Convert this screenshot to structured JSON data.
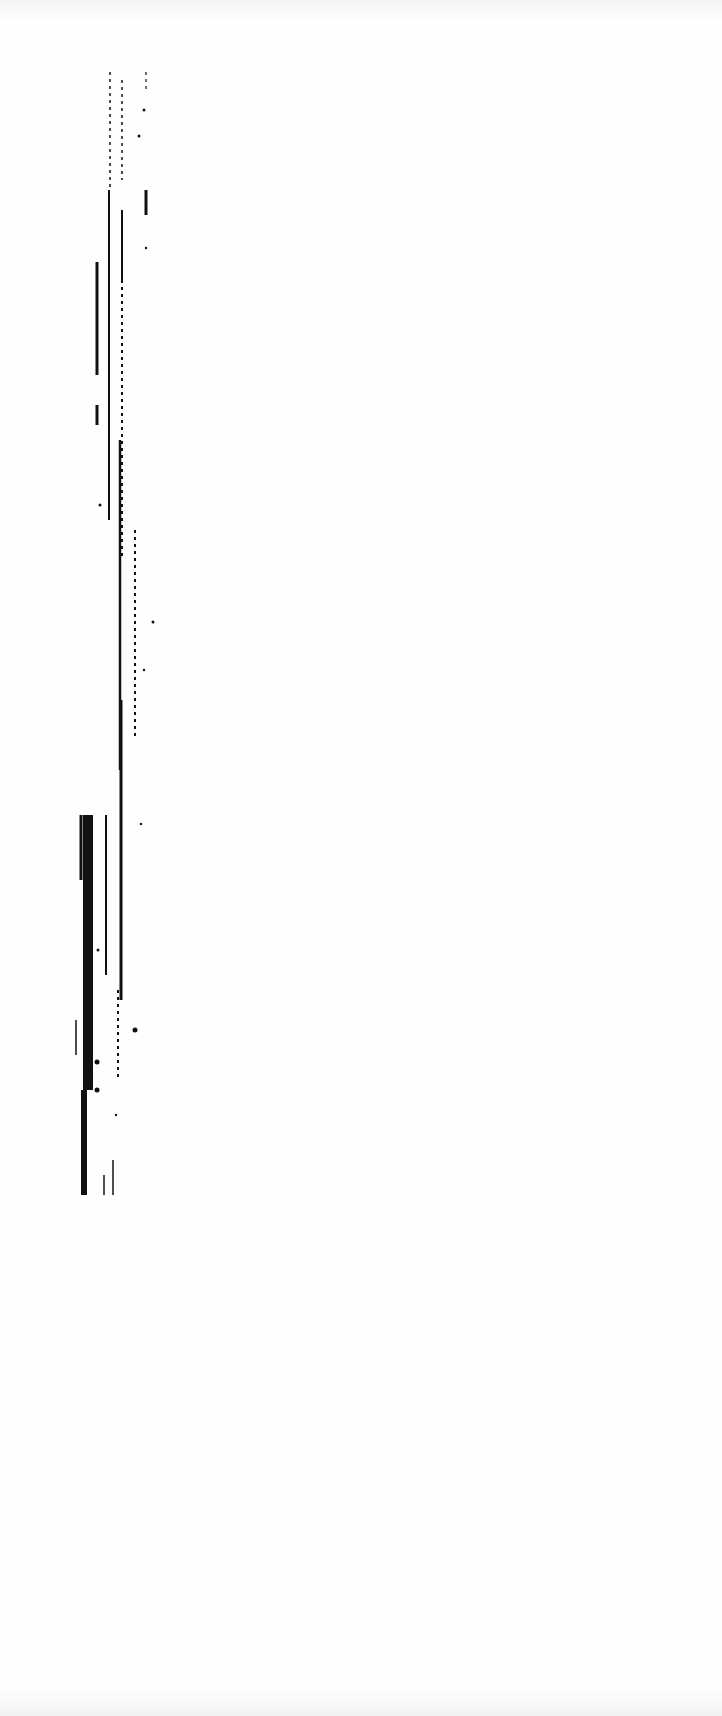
{
  "document": {
    "type": "scanned-page",
    "legible_text": "",
    "background": "#fefefe",
    "ink_color": "#111111"
  },
  "scan_marks": {
    "lines": [
      {
        "x": 110,
        "y1": 72,
        "y2": 190,
        "w": 1.5,
        "dashed": true
      },
      {
        "x": 122,
        "y1": 80,
        "y2": 180,
        "w": 1.5,
        "dashed": true
      },
      {
        "x": 146,
        "y1": 72,
        "y2": 90,
        "w": 1.2,
        "dashed": true
      },
      {
        "x": 146,
        "y1": 190,
        "y2": 215,
        "w": 3,
        "dashed": false
      },
      {
        "x": 97,
        "y1": 262,
        "y2": 375,
        "w": 3,
        "dashed": false
      },
      {
        "x": 97,
        "y1": 405,
        "y2": 425,
        "w": 3,
        "dashed": false
      },
      {
        "x": 109,
        "y1": 190,
        "y2": 520,
        "w": 2,
        "dashed": false
      },
      {
        "x": 122,
        "y1": 210,
        "y2": 280,
        "w": 2,
        "dashed": false
      },
      {
        "x": 122,
        "y1": 280,
        "y2": 560,
        "w": 2,
        "dashed": true
      },
      {
        "x": 120,
        "y1": 440,
        "y2": 770,
        "w": 2.5,
        "dashed": false
      },
      {
        "x": 121,
        "y1": 700,
        "y2": 1000,
        "w": 3,
        "dashed": false
      },
      {
        "x": 135,
        "y1": 530,
        "y2": 740,
        "w": 2,
        "dashed": true
      },
      {
        "x": 118,
        "y1": 990,
        "y2": 1080,
        "w": 2,
        "dashed": true
      },
      {
        "x": 88,
        "y1": 815,
        "y2": 1090,
        "w": 10,
        "dashed": false
      },
      {
        "x": 84,
        "y1": 1090,
        "y2": 1195,
        "w": 6,
        "dashed": false
      },
      {
        "x": 81,
        "y1": 815,
        "y2": 880,
        "w": 3,
        "dashed": false
      },
      {
        "x": 106,
        "y1": 815,
        "y2": 975,
        "w": 2,
        "dashed": false
      },
      {
        "x": 76,
        "y1": 1020,
        "y2": 1055,
        "w": 1.5,
        "dashed": false
      },
      {
        "x": 113,
        "y1": 1160,
        "y2": 1195,
        "w": 1.5,
        "dashed": false
      },
      {
        "x": 104,
        "y1": 1175,
        "y2": 1195,
        "w": 1.5,
        "dashed": false
      }
    ],
    "dots": [
      {
        "x": 144,
        "y": 110,
        "r": 1.5
      },
      {
        "x": 139,
        "y": 136,
        "r": 1.5
      },
      {
        "x": 146,
        "y": 248,
        "r": 1.2
      },
      {
        "x": 100,
        "y": 505,
        "r": 1.5
      },
      {
        "x": 153,
        "y": 622,
        "r": 1.5
      },
      {
        "x": 144,
        "y": 670,
        "r": 1.2
      },
      {
        "x": 141,
        "y": 824,
        "r": 1.2
      },
      {
        "x": 135,
        "y": 1030,
        "r": 2.5
      },
      {
        "x": 97,
        "y": 1062,
        "r": 2.5
      },
      {
        "x": 97,
        "y": 1090,
        "r": 2.5
      },
      {
        "x": 116,
        "y": 1115,
        "r": 1.2
      },
      {
        "x": 98,
        "y": 950,
        "r": 1.5
      }
    ]
  }
}
